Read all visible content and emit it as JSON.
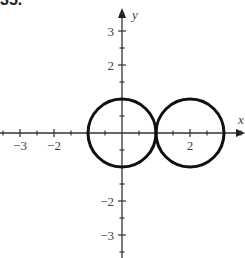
{
  "chart_data": {
    "type": "line",
    "title": "",
    "xlabel": "x",
    "ylabel": "y",
    "xlim": [
      -3.6,
      3.6
    ],
    "ylim": [
      -3.6,
      3.6
    ],
    "grid": false,
    "x_ticks": [
      -3,
      -2,
      2
    ],
    "x_tick_labels": [
      "−3",
      "−2",
      "2"
    ],
    "y_ticks": [
      3,
      2,
      -2,
      -3
    ],
    "y_tick_labels": [
      "3",
      "2",
      "−2",
      "−3"
    ],
    "minor_tick_step": 0.5,
    "series": [
      {
        "name": "circle-left",
        "shape": "circle",
        "center": [
          0,
          0
        ],
        "radius": 1
      },
      {
        "name": "circle-right",
        "shape": "circle",
        "center": [
          2,
          0
        ],
        "radius": 1
      }
    ]
  },
  "header_fragment": "35."
}
